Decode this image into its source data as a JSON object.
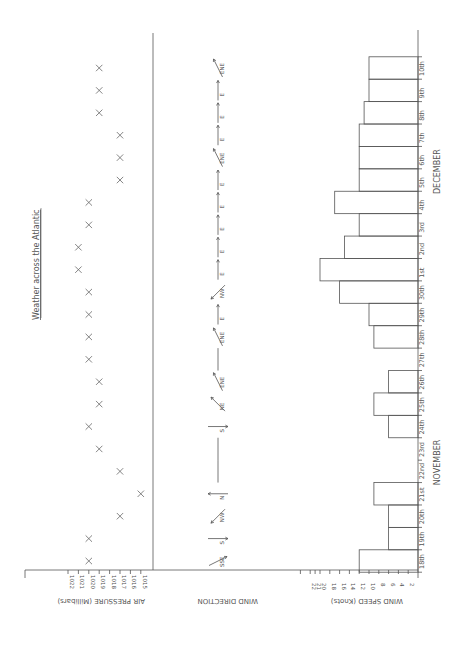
{
  "chart_data": {
    "type": "combined",
    "title": "Weather across the Atlantic",
    "orientation": "rotated-90-clockwise",
    "categories": [
      "18th",
      "19th",
      "20th",
      "21st",
      "22nd",
      "23rd",
      "24th",
      "25th",
      "26th",
      "27th",
      "28th",
      "29th",
      "30th",
      "1st",
      "2nd",
      "3rd",
      "4th",
      "5th",
      "6th",
      "7th",
      "8th",
      "9th",
      "10th"
    ],
    "month_labels": [
      {
        "label": "NOVEMBER",
        "from": "18th",
        "to": "30th"
      },
      {
        "label": "DECEMBER",
        "from": "1st",
        "to": "10th"
      }
    ],
    "panels": [
      {
        "name": "air_pressure",
        "type": "scatter",
        "ylabel": "AIR PRESSURE (Millibars)",
        "ticks": [
          1022,
          1021,
          1020,
          1019,
          1018,
          1017,
          1016,
          1015
        ],
        "ylim": [
          1015,
          1022
        ],
        "marker": "x",
        "values": [
          1020,
          1020,
          1017,
          1015,
          1017,
          1019,
          1020,
          1019,
          1019,
          1020,
          1020,
          1020,
          1020,
          1021,
          1021,
          1020,
          1020,
          1017,
          1017,
          1017,
          1019,
          1019,
          1019
        ]
      },
      {
        "name": "wind_direction",
        "type": "annotation",
        "ylabel": "WIND DIRECTION",
        "values": [
          "SSE",
          "S",
          "NW",
          "N",
          "",
          "",
          "S",
          "NE",
          "ENE",
          "",
          "ENE",
          "E",
          "NW",
          "E",
          "E",
          "E",
          "E",
          "E",
          "ENE",
          "E",
          "E",
          "E",
          "ENE",
          "E"
        ]
      },
      {
        "name": "wind_speed",
        "type": "bar",
        "ylabel": "WIND SPEED (Knots)",
        "ticks": [
          2,
          4,
          6,
          8,
          10,
          12,
          14,
          16,
          18,
          20,
          21,
          22
        ],
        "ylim": [
          0,
          22
        ],
        "values": [
          12,
          6,
          6,
          9,
          0,
          0,
          6,
          9,
          6,
          0,
          9,
          10,
          16,
          20,
          15,
          12,
          17,
          12,
          12,
          12,
          11,
          10,
          10
        ]
      }
    ]
  },
  "labels": {
    "title": "Weather across the Atlantic",
    "pressure_axis": "AIR PRESSURE (Millibars)",
    "direction_axis": "WIND DIRECTION",
    "speed_axis": "WIND SPEED (Knots)",
    "november": "NOVEMBER",
    "december": "DECEMBER"
  }
}
